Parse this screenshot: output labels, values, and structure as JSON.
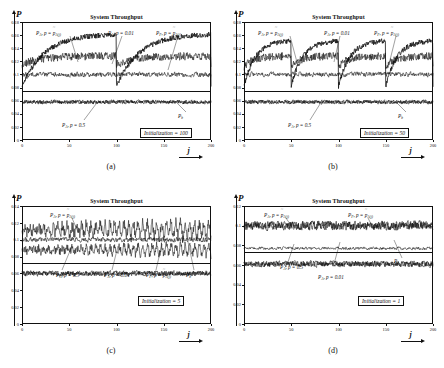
{
  "figure": {
    "panels": [
      {
        "caption": "(a)",
        "title": "System Throughput",
        "ylabel_main": "P",
        "ylabel_sub": "",
        "init_label": "Initialization = 100",
        "init_value": 100,
        "yticks": [
          "0",
          "0.02",
          "0.04",
          "0.06",
          "0.08",
          "0.1",
          "0.12",
          "0.14",
          "0.16",
          "0.18"
        ],
        "xticks": [
          "0",
          "50",
          "100",
          "150",
          "200"
        ],
        "xlabel": "j",
        "annotations": [
          {
            "name": "pa-adaptive",
            "text": "P_A, p = p_A(j)"
          },
          {
            "name": "pa-001",
            "text": "P_A, p = 0.01"
          },
          {
            "name": "pf-adaptive",
            "text": "P_F, p = p_A(j)"
          },
          {
            "name": "pa-05",
            "text": "P_A, p = 0.5"
          },
          {
            "name": "pb",
            "text": "P_b"
          }
        ]
      },
      {
        "caption": "(b)",
        "title": "System Throughput",
        "ylabel_main": "P",
        "ylabel_sub": "",
        "init_label": "Initialization = 50",
        "init_value": 50,
        "yticks": [
          "0",
          "0.02",
          "0.04",
          "0.06",
          "0.08",
          "0.1",
          "0.12",
          "0.14",
          "0.16",
          "0.18"
        ],
        "xticks": [
          "0",
          "50",
          "100",
          "150",
          "200"
        ],
        "xlabel": "j",
        "annotations": [
          {
            "name": "pa-adaptive",
            "text": "P_A, p = p_A(j)"
          },
          {
            "name": "pa-001",
            "text": "P_A, p = 0.01"
          },
          {
            "name": "pf-adaptive",
            "text": "P_F, p = p_A(j)"
          },
          {
            "name": "pa-05",
            "text": "P_A, p = 0.5"
          },
          {
            "name": "pb",
            "text": "P_b"
          }
        ]
      },
      {
        "caption": "(c)",
        "title": "System Throughput",
        "ylabel_main": "P",
        "ylabel_sub": "",
        "init_label": "Initialization = 5",
        "init_value": 5,
        "yticks": [
          "0",
          "0.02",
          "0.04",
          "0.06",
          "0.08",
          "0.1",
          "0.12",
          "0.14"
        ],
        "xticks": [
          "0",
          "50",
          "100",
          "150",
          "200"
        ],
        "xlabel": "j",
        "annotations": [
          {
            "name": "pa-adaptive",
            "text": "P_A, p = p_A(j)"
          },
          {
            "name": "pa-05",
            "text": "P_A, p = 0.5"
          },
          {
            "name": "pa-001",
            "text": "P_A, p = 0.01"
          },
          {
            "name": "pf-adaptive",
            "text": "P_F, p = p_A(j)"
          },
          {
            "name": "pb",
            "text": "P_b"
          }
        ]
      },
      {
        "caption": "(d)",
        "title": "System Throughput",
        "ylabel_main": "P",
        "ylabel_sub": "",
        "init_label": "Initialization = 1",
        "init_value": 1,
        "yticks": [
          "0",
          "0.02",
          "0.04",
          "0.06",
          "0.08",
          "0.1",
          "0.12"
        ],
        "xticks": [
          "0",
          "50",
          "100",
          "150",
          "200"
        ],
        "xlabel": "j",
        "annotations": [
          {
            "name": "pa-adaptive",
            "text": "P_A, p = p_A(j)"
          },
          {
            "name": "pf-adaptive",
            "text": "P_F, p = p_A(j)"
          },
          {
            "name": "pa-05",
            "text": "P_A, p = 0.5"
          },
          {
            "name": "pa-001",
            "text": "P_A, p = 0.01"
          },
          {
            "name": "pb",
            "text": "P_b"
          }
        ]
      }
    ]
  },
  "chart_data": [
    {
      "type": "line",
      "title": "System Throughput",
      "panel": "(a)",
      "xlabel": "j",
      "ylabel": "P",
      "xlim": [
        0,
        200
      ],
      "ylim": [
        0,
        0.18
      ],
      "grid": false,
      "legend": "inline-annotations",
      "init_period": 100,
      "series": [
        {
          "name": "P_A, p = p_A(j)",
          "style": "sawtooth-rising",
          "baseline": 0.082,
          "peak": 0.162,
          "noise": 0.004,
          "period": 100,
          "description": "Adaptive curve rising from ~0.082 to ~0.162 then resetting each initialization period"
        },
        {
          "name": "P_F, p = p_A(j)",
          "style": "noisy-flat-rising",
          "baseline": 0.115,
          "peak": 0.128,
          "noise": 0.006,
          "period": 100
        },
        {
          "name": "P_A, p = 0.01",
          "style": "noisy-flat",
          "mean": 0.1,
          "noise": 0.005
        },
        {
          "name": "P_A, p = 0.5",
          "style": "noisy-flat",
          "mean": 0.058,
          "noise": 0.004
        },
        {
          "name": "P_b",
          "style": "noisy-flat",
          "mean": 0.058,
          "noise": 0.004
        }
      ]
    },
    {
      "type": "line",
      "title": "System Throughput",
      "panel": "(b)",
      "xlabel": "j",
      "ylabel": "P",
      "xlim": [
        0,
        200
      ],
      "ylim": [
        0,
        0.18
      ],
      "grid": false,
      "legend": "inline-annotations",
      "init_period": 50,
      "series": [
        {
          "name": "P_A, p = p_A(j)",
          "style": "sawtooth-rising",
          "baseline": 0.082,
          "peak": 0.152,
          "noise": 0.004,
          "period": 50
        },
        {
          "name": "P_F, p = p_A(j)",
          "style": "noisy-flat-rising",
          "baseline": 0.112,
          "peak": 0.128,
          "noise": 0.006,
          "period": 50
        },
        {
          "name": "P_A, p = 0.01",
          "style": "noisy-flat",
          "mean": 0.1,
          "noise": 0.005
        },
        {
          "name": "P_A, p = 0.5",
          "style": "noisy-flat",
          "mean": 0.058,
          "noise": 0.004
        },
        {
          "name": "P_b",
          "style": "noisy-flat",
          "mean": 0.058,
          "noise": 0.004
        }
      ]
    },
    {
      "type": "line",
      "title": "System Throughput",
      "panel": "(c)",
      "xlabel": "j",
      "ylabel": "P",
      "xlim": [
        0,
        200
      ],
      "ylim": [
        0,
        0.14
      ],
      "grid": false,
      "legend": "inline-annotations",
      "init_period": 5,
      "series": [
        {
          "name": "P_A, p = p_A(j)",
          "style": "high-frequency-oscillation",
          "mean": 0.112,
          "amplitude": 0.014,
          "period": 5
        },
        {
          "name": "P_F, p = p_A(j)",
          "style": "high-frequency-oscillation",
          "mean": 0.088,
          "amplitude": 0.01,
          "period": 5
        },
        {
          "name": "P_A, p = 0.01",
          "style": "noisy-flat",
          "mean": 0.1,
          "noise": 0.004
        },
        {
          "name": "P_A, p = 0.5",
          "style": "noisy-flat",
          "mean": 0.06,
          "noise": 0.004
        },
        {
          "name": "P_b",
          "style": "noisy-flat",
          "mean": 0.06,
          "noise": 0.004
        }
      ]
    },
    {
      "type": "line",
      "title": "System Throughput",
      "panel": "(d)",
      "xlabel": "j",
      "ylabel": "P",
      "xlim": [
        0,
        200
      ],
      "ylim": [
        0,
        0.12
      ],
      "grid": false,
      "legend": "inline-annotations",
      "init_period": 1,
      "series": [
        {
          "name": "P_A, p = p_A(j)",
          "style": "noisy-flat",
          "mean": 0.1,
          "noise": 0.006
        },
        {
          "name": "P_F, p = p_A(j)",
          "style": "noisy-flat",
          "mean": 0.1,
          "noise": 0.006
        },
        {
          "name": "P_A, p = 0.01",
          "style": "noisy-flat",
          "mean": 0.077,
          "noise": 0.002
        },
        {
          "name": "P_A, p = 0.5",
          "style": "noisy-flat",
          "mean": 0.061,
          "noise": 0.004
        },
        {
          "name": "P_b",
          "style": "noisy-flat",
          "mean": 0.061,
          "noise": 0.004
        }
      ]
    }
  ]
}
